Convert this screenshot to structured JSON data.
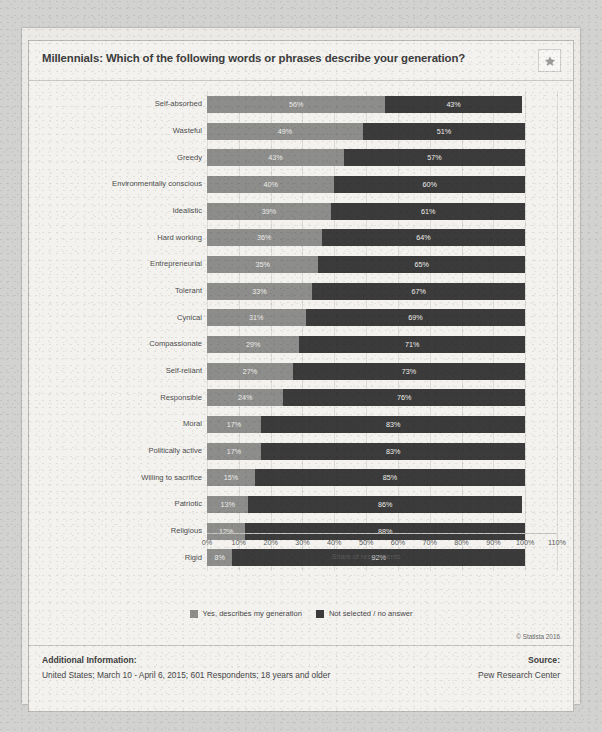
{
  "header": {
    "title": "Millennials: Which of the following words or phrases describe your generation?",
    "favorite_icon": "star-icon"
  },
  "colors": {
    "series_yes": "#8d8d8b",
    "series_no": "#3b3b3b",
    "card_background": "#f3f2ef",
    "text": "#474747"
  },
  "legend": {
    "position": "bottom",
    "items": [
      {
        "label": "Yes, describes my generation",
        "color": "#8d8d8b"
      },
      {
        "label": "Not selected / no answer",
        "color": "#3b3b3b"
      }
    ]
  },
  "footer": {
    "additional_information_heading": "Additional Information:",
    "additional_information_body": "United States; March 10 - April 6, 2015; 601 Respondents; 18 years and older",
    "source_heading": "Source:",
    "source_body": "Pew Research Center",
    "copyright": "© Statista 2016"
  },
  "chart_data": {
    "type": "bar",
    "orientation": "horizontal",
    "stacked": true,
    "title": "Millennials: Which of the following words or phrases describe your generation?",
    "xlabel": "Share of respondents",
    "ylabel": "",
    "xlim": [
      0,
      110
    ],
    "xticks": [
      0,
      10,
      20,
      30,
      40,
      50,
      60,
      70,
      80,
      90,
      100,
      110
    ],
    "xtick_labels": [
      "0%",
      "10%",
      "20%",
      "30%",
      "40%",
      "50%",
      "60%",
      "70%",
      "80%",
      "90%",
      "100%",
      "110%"
    ],
    "grid": true,
    "categories": [
      "Self-absorbed",
      "Wasteful",
      "Greedy",
      "Environmentally conscious",
      "Idealistic",
      "Hard working",
      "Entrepreneurial",
      "Tolerant",
      "Cynical",
      "Compassionate",
      "Self-reliant",
      "Responsible",
      "Moral",
      "Politically active",
      "Willing to sacrifice",
      "Patriotic",
      "Religious",
      "Rigid"
    ],
    "series": [
      {
        "name": "Yes, describes my generation",
        "color": "#8d8d8b",
        "values": [
          56,
          49,
          43,
          40,
          39,
          36,
          35,
          33,
          31,
          29,
          27,
          24,
          17,
          17,
          15,
          13,
          12,
          8
        ],
        "labels": [
          "56%",
          "49%",
          "43%",
          "40%",
          "39%",
          "36%",
          "35%",
          "33%",
          "31%",
          "29%",
          "27%",
          "24%",
          "17%",
          "17%",
          "15%",
          "13%",
          "12%",
          "8%"
        ]
      },
      {
        "name": "Not selected / no answer",
        "color": "#3b3b3b",
        "values": [
          43,
          51,
          57,
          60,
          61,
          64,
          65,
          67,
          69,
          71,
          73,
          76,
          83,
          83,
          85,
          86,
          88,
          92
        ],
        "labels": [
          "43%",
          "51%",
          "57%",
          "60%",
          "61%",
          "64%",
          "65%",
          "67%",
          "69%",
          "71%",
          "73%",
          "76%",
          "83%",
          "83%",
          "85%",
          "86%",
          "88%",
          "92%"
        ]
      }
    ]
  }
}
